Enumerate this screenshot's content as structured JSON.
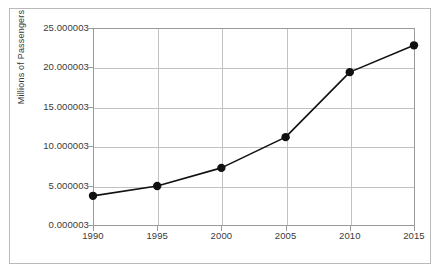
{
  "chart_data": {
    "type": "line",
    "title": "",
    "subtitle": "",
    "xlabel": "",
    "ylabel": "Millions of Passengers",
    "categories": [
      "1990",
      "1995",
      "2000",
      "2005",
      "2010",
      "2015"
    ],
    "x": [
      1990,
      1995,
      2000,
      2005,
      2010,
      2015
    ],
    "values": [
      3.7,
      4.95,
      7.25,
      11.15,
      19.4,
      22.8
    ],
    "series": [
      {
        "name": "Passengers",
        "values": [
          3.7,
          4.95,
          7.25,
          11.15,
          19.4,
          22.8
        ],
        "color": "#111111",
        "marker": "circle"
      }
    ],
    "ytick_labels": [
      "0.000003",
      "5.000003",
      "10.000003",
      "15.000003",
      "20.000003",
      "25.000003"
    ],
    "ytick_values": [
      0,
      5,
      10,
      15,
      20,
      25
    ],
    "xtick_labels": [
      "1990",
      "1995",
      "2000",
      "2005",
      "2010",
      "2015"
    ],
    "ylim": [
      0,
      25
    ],
    "xlim": [
      1990,
      2015
    ],
    "grid": "both",
    "legend": "none",
    "colors": {
      "line": "#111111",
      "marker": "#111111",
      "grid": "#c2c2c2",
      "axis": "#9a9a9a",
      "outer_border": "#b9b9b9",
      "text": "#3a3a3a",
      "background": "#ffffff"
    }
  }
}
